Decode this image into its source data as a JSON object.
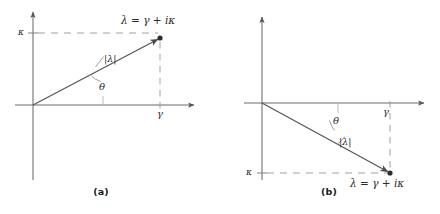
{
  "figure": {
    "type": "complex-plane-vector-diagram",
    "background_color": "#ffffff",
    "line_color": "#55565a",
    "dash_color": "#9a9ba0",
    "text_color": "#2a2a2a",
    "panels": [
      {
        "id": "a",
        "caption": "(a)",
        "description": "Complex eigenvalue with positive imaginary part in the upper half plane",
        "axes": {
          "origin": [
            33,
            105
          ],
          "horizontal_axis": {
            "label": "γ",
            "from": [
              15,
              105
            ],
            "to": [
              198,
              105
            ]
          },
          "vertical_axis": {
            "label": "κ",
            "from": [
              33,
              180
            ],
            "to": [
              33,
              9
            ]
          }
        },
        "point": {
          "x": 160,
          "y": 38,
          "label": "λ = γ + iκ"
        },
        "vector": {
          "label": "|λ|",
          "from": [
            33,
            105
          ],
          "to": [
            160,
            38
          ]
        },
        "angle": {
          "label": "θ",
          "vertex": [
            33,
            105
          ]
        },
        "guides": [
          {
            "kind": "dashed-horizontal",
            "label": "κ",
            "y": 33,
            "from_x": 28,
            "to_x": 160
          },
          {
            "kind": "dashed-vertical",
            "label": "γ",
            "x": 160,
            "from_y": 38,
            "to_y": 105
          }
        ]
      },
      {
        "id": "b",
        "caption": "(b)",
        "description": "Complex eigenvalue with negative imaginary part in the lower half plane",
        "axes": {
          "origin": [
            262,
            103
          ],
          "horizontal_axis": {
            "label": "γ",
            "from": [
              244,
              103
            ],
            "to": [
              428,
              103
            ]
          },
          "vertical_axis": {
            "label": "κ",
            "from": [
              262,
              180
            ],
            "to": [
              262,
              14
            ]
          }
        },
        "point": {
          "x": 390,
          "y": 173,
          "label": "λ = γ + iκ"
        },
        "vector": {
          "label": "|λ|",
          "from": [
            262,
            103
          ],
          "to": [
            390,
            173
          ]
        },
        "angle": {
          "label": "θ",
          "vertex": [
            262,
            103
          ]
        },
        "guides": [
          {
            "kind": "dashed-horizontal",
            "label": "κ",
            "y": 173,
            "from_x": 257,
            "to_x": 390
          },
          {
            "kind": "dashed-vertical",
            "label": "γ",
            "x": 390,
            "from_y": 103,
            "to_y": 173
          }
        ]
      }
    ]
  },
  "labels": {
    "kappa": "κ",
    "gamma": "γ",
    "theta": "θ",
    "modulus": "|λ|",
    "equation": "λ = γ + iκ",
    "caption_a": "(a)",
    "caption_b": "(b)"
  }
}
